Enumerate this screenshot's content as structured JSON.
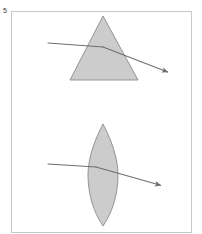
{
  "figure": {
    "label": "5",
    "caption": "",
    "background_color": "#ffffff",
    "border_color": "#c8c8c8",
    "optic_fill_color": "#cccccc",
    "optic_stroke_color": "#8a8a8a",
    "ray_color": "#6e6e6e",
    "frame": {
      "x": 11,
      "y": 11,
      "width": 180,
      "height": 221
    }
  },
  "panels": [
    {
      "name": "prism-panel",
      "optic_type": "triangular-prism",
      "optic_label": "",
      "apex": {
        "x": 103,
        "y": 16
      },
      "base_left": {
        "x": 70,
        "y": 80
      },
      "base_right": {
        "x": 138,
        "y": 80
      },
      "incident_ray": {
        "label": "",
        "start": {
          "x": 48,
          "y": 43
        },
        "end": {
          "x": 103,
          "y": 47
        }
      },
      "refracted_ray": {
        "label": "",
        "start": {
          "x": 103,
          "y": 47
        },
        "end": {
          "x": 170,
          "y": 73
        },
        "arrowhead": true
      }
    },
    {
      "name": "lens-panel",
      "optic_type": "biconvex-lens",
      "optic_label": "",
      "top_tip": {
        "x": 103,
        "y": 124
      },
      "bottom_tip": {
        "x": 103,
        "y": 226
      },
      "left_extent": {
        "x": 88,
        "y": 175
      },
      "right_extent": {
        "x": 118,
        "y": 175
      },
      "incident_ray": {
        "label": "",
        "start": {
          "x": 48,
          "y": 164
        },
        "end": {
          "x": 96,
          "y": 167
        }
      },
      "refracted_ray": {
        "start": {
          "x": 96,
          "y": 167
        },
        "end": {
          "x": 163,
          "y": 186
        },
        "arrowhead": true
      }
    }
  ]
}
